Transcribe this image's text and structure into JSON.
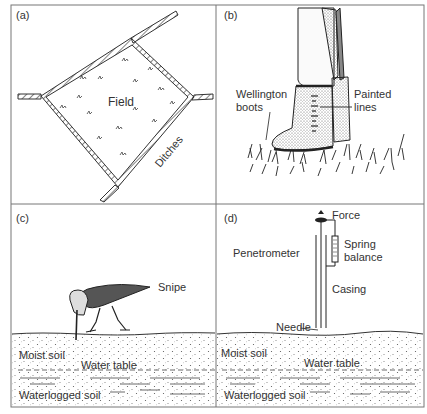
{
  "figure": {
    "panels": [
      {
        "id": "a",
        "panel_label": "(a)",
        "labels": {
          "field": "Field",
          "ditches": "Ditches"
        }
      },
      {
        "id": "b",
        "panel_label": "(b)",
        "labels": {
          "boots_line1": "Wellington",
          "boots_line2": "boots",
          "painted_line1": "Painted",
          "painted_line2": "lines"
        }
      },
      {
        "id": "c",
        "panel_label": "(c)",
        "labels": {
          "snipe": "Snipe",
          "moist_soil": "Moist soil",
          "water_table": "Water table",
          "waterlogged_soil": "Waterlogged soil"
        }
      },
      {
        "id": "d",
        "panel_label": "(d)",
        "labels": {
          "force": "Force",
          "penetrometer": "Penetrometer",
          "spring_line1": "Spring",
          "spring_line2": "balance",
          "casing": "Casing",
          "needle": "Needle",
          "moist_soil": "Moist soil",
          "water_table": "Water table",
          "waterlogged_soil": "Waterlogged soil"
        }
      }
    ],
    "colors": {
      "ink": "#2a2a2a",
      "frame": "#777777",
      "background": "#ffffff"
    }
  }
}
